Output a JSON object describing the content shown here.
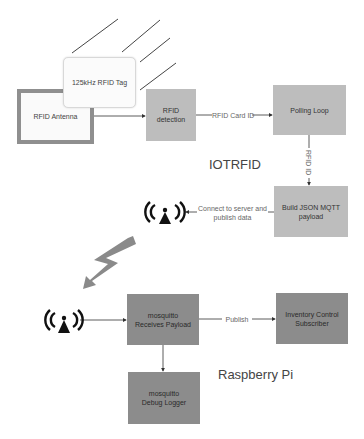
{
  "diagram": {
    "titles": {
      "iot": "IOTRFID",
      "pi": "Raspberry Pi"
    },
    "nodes": {
      "tag": "125kHz RFID Tag",
      "antenna": "RFID Antenna",
      "detection": "RFID detection",
      "polling": "Polling Loop",
      "build": "Build JSON MQTT payload",
      "mosquitto": "mosquitto Receives Payload",
      "inventory": "Inventory Control Subscriber",
      "logger": "mosquitto Debug Logger"
    },
    "edges": {
      "card_id": "RFID Card ID",
      "rfid_id": "RFID ID",
      "connect_line1": "Connect to server and",
      "connect_line2": "publish data",
      "publish": "Publish"
    },
    "icons": [
      "wireless-signal-icon",
      "lightning-bolt-icon",
      "wireless-signal-icon"
    ],
    "colors": {
      "light_box": "#bdbdbd",
      "dark_box": "#8c8c8c",
      "antenna_border": "#8f8f8f",
      "bolt": "#8a8a8a"
    }
  }
}
